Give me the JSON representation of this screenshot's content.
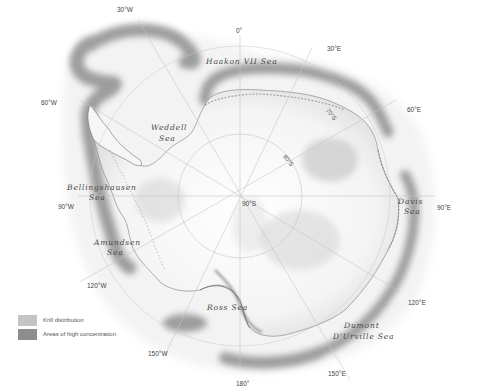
{
  "map": {
    "title": "Antarctic krill distribution",
    "pole_label": "90°S",
    "latitude_labels": [
      "80°S",
      "70°S"
    ],
    "longitude_labels": {
      "lon_0": "0°",
      "lon_30e": "30°E",
      "lon_60e": "60°E",
      "lon_90e": "90°E",
      "lon_120e": "120°E",
      "lon_150e": "150°E",
      "lon_180": "180°",
      "lon_150w": "150°W",
      "lon_120w": "120°W",
      "lon_90w": "90°W",
      "lon_60w": "60°W",
      "lon_30w": "30°W"
    },
    "seas": {
      "haakon": "Haakon VII Sea",
      "weddell_1": "Weddell",
      "weddell_2": "Sea",
      "bellingshausen_1": "Bellingshausen",
      "bellingshausen_2": "Sea",
      "amundsen_1": "Amundsen",
      "amundsen_2": "Sea",
      "ross": "Ross   Sea",
      "davis_1": "Davis",
      "davis_2": "Sea",
      "dumont_1": "Dumont",
      "dumont_2": "D'Urville Sea"
    },
    "colors": {
      "krill_distribution": "#f1f1f1",
      "high_concentration": "#8a8a8a",
      "land": "#fbfbfb",
      "grid": "#c8c8c8"
    }
  },
  "legend": {
    "items": [
      {
        "label": "Krill distribution",
        "color": "#c4c4c4"
      },
      {
        "label": "Areas of high concentration",
        "color": "#8d8d8d"
      }
    ]
  }
}
